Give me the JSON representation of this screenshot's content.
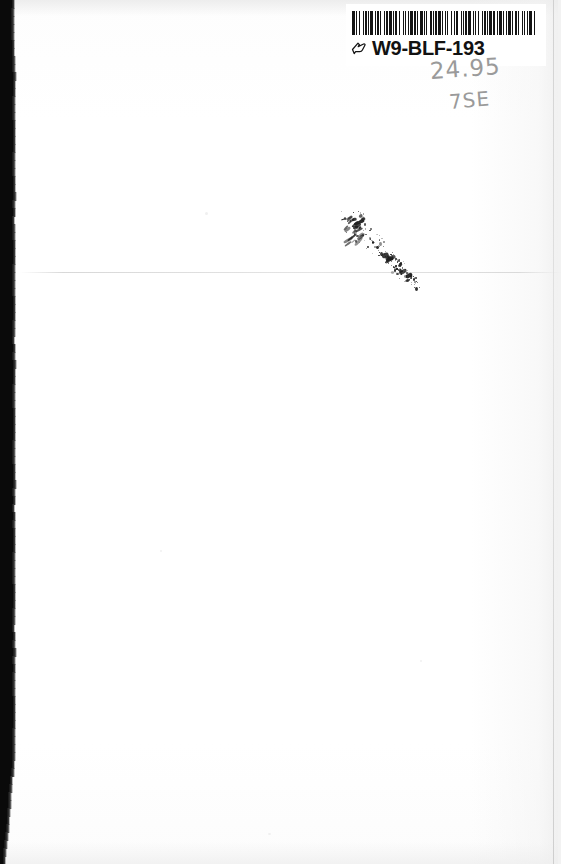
{
  "document": {
    "type": "scanned-page",
    "description": "Blank white page (book flyleaf / inside cover) scan",
    "page_width": 561,
    "page_height": 864,
    "background_color": "#ffffff",
    "body_text": ""
  },
  "label": {
    "name": "inventory-barcode-label",
    "code_text": "W9-BLF-193",
    "icon_name": "pointing-hand-icon",
    "barcode_symbology": "Code 39",
    "barcode_ink_color": "#141414",
    "text_color": "#121212",
    "bars": [
      3,
      1,
      1,
      2,
      1,
      3,
      1,
      1,
      2,
      1,
      1,
      1,
      3,
      2,
      1,
      1,
      2,
      1,
      1,
      3,
      1,
      1,
      2,
      1,
      3,
      1,
      1,
      1,
      2,
      2,
      1,
      3,
      1,
      1,
      1,
      2,
      1,
      1,
      3,
      1,
      2,
      1,
      1,
      2,
      3,
      1,
      1,
      1,
      1,
      3,
      2,
      1,
      1,
      1,
      2,
      1,
      3,
      1,
      1,
      2,
      1,
      1,
      1,
      3,
      1,
      2,
      1,
      1,
      2,
      3,
      1,
      1,
      1,
      1,
      2,
      1,
      3,
      2,
      1,
      1,
      1,
      2,
      1,
      3,
      1,
      1,
      2,
      1,
      1,
      1,
      3,
      1,
      2,
      2,
      1,
      1,
      3,
      1,
      1,
      2,
      1,
      1,
      3,
      1,
      1,
      2,
      2,
      1,
      1,
      3,
      1,
      1,
      1,
      2,
      1,
      1,
      3,
      2,
      1,
      1
    ]
  },
  "handwriting": {
    "name": "handwritten-annotations",
    "price": "24.95",
    "code": "7SE",
    "medium": "pencil",
    "color": "#9a9a9a"
  },
  "marks": {
    "ink_smudge": {
      "name": "ink-smudge-mark",
      "orientation": "diagonal",
      "color": "#1d1d1d"
    },
    "crease": {
      "name": "horizontal-fold-crease",
      "y": 272,
      "color": "#d6d6d6"
    },
    "scan_edge": {
      "name": "left-scan-gutter-shadow",
      "color": "#0a0a0a"
    }
  }
}
